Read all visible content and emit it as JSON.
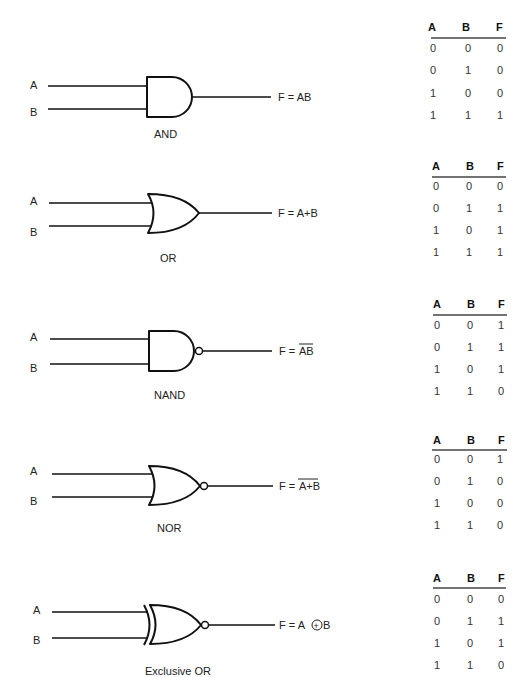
{
  "gates": [
    {
      "name": "AND",
      "input_a": "A",
      "input_b": "B",
      "output_prefix": "F = ",
      "output_expr": "AB",
      "output_overbar": false,
      "truth_table": {
        "headers": [
          "A",
          "B",
          "F"
        ],
        "rows": [
          [
            "0",
            "0",
            "0"
          ],
          [
            "0",
            "1",
            "0"
          ],
          [
            "1",
            "0",
            "0"
          ],
          [
            "1",
            "1",
            "1"
          ]
        ]
      }
    },
    {
      "name": "OR",
      "input_a": "A",
      "input_b": "B",
      "output_prefix": "F = ",
      "output_expr": "A+B",
      "output_overbar": false,
      "truth_table": {
        "headers": [
          "A",
          "B",
          "F"
        ],
        "rows": [
          [
            "0",
            "0",
            "0"
          ],
          [
            "0",
            "1",
            "1"
          ],
          [
            "1",
            "0",
            "1"
          ],
          [
            "1",
            "1",
            "1"
          ]
        ]
      }
    },
    {
      "name": "NAND",
      "input_a": "A",
      "input_b": "B",
      "output_prefix": "F = ",
      "output_expr": "AB",
      "output_overbar": true,
      "truth_table": {
        "headers": [
          "A",
          "B",
          "F"
        ],
        "rows": [
          [
            "0",
            "0",
            "1"
          ],
          [
            "0",
            "1",
            "1"
          ],
          [
            "1",
            "0",
            "1"
          ],
          [
            "1",
            "1",
            "0"
          ]
        ]
      }
    },
    {
      "name": "NOR",
      "input_a": "A",
      "input_b": "B",
      "output_prefix": "F = ",
      "output_expr": "A+B",
      "output_overbar": true,
      "truth_table": {
        "headers": [
          "A",
          "B",
          "F"
        ],
        "rows": [
          [
            "0",
            "0",
            "1"
          ],
          [
            "0",
            "1",
            "0"
          ],
          [
            "1",
            "0",
            "0"
          ],
          [
            "1",
            "1",
            "0"
          ]
        ]
      }
    },
    {
      "name": "Exclusive OR",
      "input_a": "A",
      "input_b": "B",
      "output_prefix": "F = A ",
      "output_symbol": "+",
      "output_suffix": " B",
      "output_overbar": false,
      "truth_table": {
        "headers": [
          "A",
          "B",
          "F"
        ],
        "rows": [
          [
            "0",
            "0",
            "0"
          ],
          [
            "0",
            "1",
            "1"
          ],
          [
            "1",
            "0",
            "1"
          ],
          [
            "1",
            "1",
            "0"
          ]
        ]
      }
    }
  ]
}
